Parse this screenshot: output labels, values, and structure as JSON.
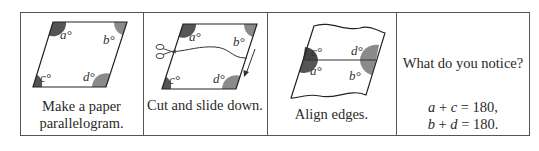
{
  "panels": [
    {
      "id": "make",
      "caption_line1": "Make a paper",
      "caption_line2": "parallelogram."
    },
    {
      "id": "cut",
      "caption": "Cut and slide down."
    },
    {
      "id": "align",
      "caption": "Align edges."
    },
    {
      "id": "notice",
      "question": "What do you notice?",
      "equation1": {
        "lhs_a": "a",
        "plus": " + ",
        "lhs_b": "c",
        "rhs": " = 180,"
      },
      "equation2": {
        "lhs_a": "b",
        "plus": " + ",
        "lhs_b": "d",
        "rhs": " = 180."
      }
    }
  ],
  "angle_labels": {
    "a": "a°",
    "b": "b°",
    "c": "c°",
    "d": "d°"
  },
  "colors": {
    "dark_wedge": "#555555",
    "light_wedge": "#8a8a8a",
    "border": "#555555",
    "line": "#222222"
  }
}
